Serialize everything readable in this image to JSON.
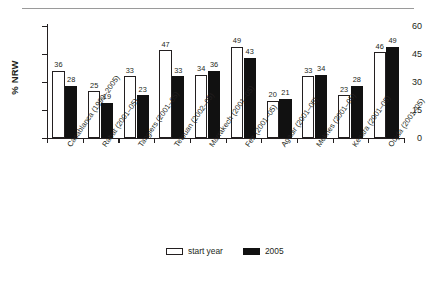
{
  "figure": {
    "y_axis_title": "% NRW",
    "legend": [
      {
        "key": "start",
        "label": "start year",
        "color": "#ffffff"
      },
      {
        "key": "y2005",
        "label": "2005",
        "color": "#111111"
      }
    ]
  },
  "chart_data": {
    "type": "bar",
    "title": "",
    "xlabel": "",
    "ylabel": "% NRW",
    "ylim": [
      0,
      60
    ],
    "yticks": [
      0,
      15,
      30,
      45,
      60
    ],
    "grid": false,
    "legend_position": "bottom-center",
    "categories": [
      "Casablanca (1999–2005)",
      "Rabat (2001–05)",
      "Tangiers (2001–05)",
      "Tetouan (2002–05)",
      "Marrakech (2001–05)",
      "Fez (2001–05)",
      "Agadir (2001–05)",
      "Meknes (2001–05)",
      "Kenitra (2001–05)",
      "Oujda (2001–05)"
    ],
    "series": [
      {
        "name": "start year",
        "color": "#ffffff",
        "values": [
          36,
          25,
          33,
          47,
          34,
          49,
          20,
          33,
          23,
          46
        ]
      },
      {
        "name": "2005",
        "color": "#111111",
        "values": [
          28,
          19,
          23,
          33,
          36,
          43,
          21,
          34,
          28,
          49
        ]
      }
    ]
  }
}
